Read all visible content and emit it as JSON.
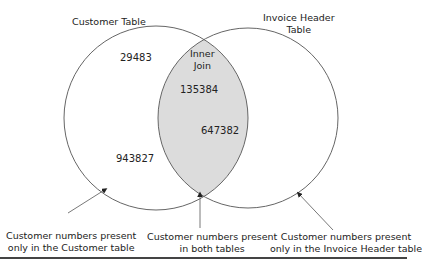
{
  "diagram": {
    "type": "venn",
    "sets": [
      {
        "label": "Customer Table",
        "values": [
          "29483",
          "943827"
        ]
      },
      {
        "label_line1": "Invoice Header",
        "label_line2": "Table",
        "values": []
      }
    ],
    "intersection": {
      "label_line1": "Inner",
      "label_line2": "Join",
      "values": [
        "135384",
        "647382"
      ],
      "fill_color": "#dcdcdc"
    },
    "annotations": [
      {
        "line1": "Customer numbers present",
        "line2": "only in the Customer table"
      },
      {
        "line1": "Customer numbers present",
        "line2": "in both tables"
      },
      {
        "line1": "Customer numbers present",
        "line2": "only in the Invoice Header table"
      }
    ],
    "colors": {
      "stroke": "#666666",
      "text": "#222222",
      "rule": "#444444"
    }
  }
}
